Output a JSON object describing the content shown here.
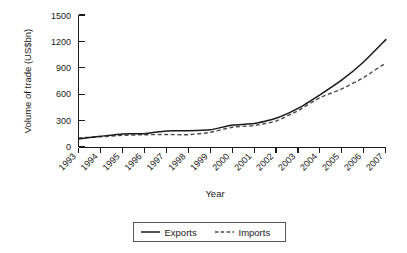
{
  "chart_data": {
    "type": "line",
    "title": "",
    "xlabel": "Year",
    "ylabel": "Volume of trade (US$bn)",
    "categories": [
      "1993",
      "1994",
      "1995",
      "1996",
      "1997",
      "1998",
      "1999",
      "2000",
      "2001",
      "2002",
      "2003",
      "2004",
      "2005",
      "2006",
      "2007"
    ],
    "x": [
      1993,
      1994,
      1995,
      1996,
      1997,
      1998,
      1999,
      2000,
      2001,
      2002,
      2003,
      2004,
      2005,
      2006,
      2007
    ],
    "series": [
      {
        "name": "Exports",
        "style": "solid",
        "color": "#1a1a1a",
        "values": [
          92,
          121,
          149,
          151,
          183,
          184,
          195,
          249,
          266,
          326,
          438,
          593,
          762,
          969,
          1220
        ]
      },
      {
        "name": "Imports",
        "style": "dashed",
        "color": "#4a4a4a",
        "values": [
          104,
          116,
          132,
          139,
          142,
          140,
          166,
          225,
          244,
          295,
          413,
          561,
          660,
          792,
          955
        ]
      }
    ],
    "ylim": [
      0,
      1500
    ],
    "yticks": [
      0,
      300,
      600,
      900,
      1200,
      1500
    ],
    "ytick_labels": [
      "0",
      "300",
      "600",
      "900",
      "1200",
      "1500"
    ],
    "grid": false,
    "legend_position": "bottom-center",
    "legend_entries": [
      {
        "label": "Exports",
        "style": "solid"
      },
      {
        "label": "Imports",
        "style": "dashed"
      }
    ]
  },
  "axes": {
    "y_title": "Volume of trade (US$bn)",
    "x_title": "Year"
  }
}
